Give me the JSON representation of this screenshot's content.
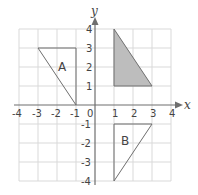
{
  "diagram": {
    "type": "coordinate-grid",
    "axes": {
      "x_label": "x",
      "y_label": "y",
      "x_range": [
        -4,
        4
      ],
      "y_range": [
        -4,
        4
      ],
      "origin_label": "0",
      "x_ticks": [
        "-4",
        "-3",
        "-2",
        "-1",
        "1",
        "2",
        "3",
        "4"
      ],
      "y_ticks": [
        "4",
        "3",
        "2",
        "1",
        "-1",
        "-2",
        "-3",
        "-4"
      ]
    },
    "shapes": [
      {
        "name": "shaded-triangle",
        "label": "",
        "vertices": [
          [
            1,
            4
          ],
          [
            1,
            1
          ],
          [
            3,
            1
          ]
        ],
        "fill": "#bdbdbd"
      },
      {
        "name": "triangle-A",
        "label": "A",
        "vertices": [
          [
            -3,
            3
          ],
          [
            -1,
            3
          ],
          [
            -1,
            0
          ]
        ],
        "fill": "none"
      },
      {
        "name": "triangle-B",
        "label": "B",
        "vertices": [
          [
            1,
            -1
          ],
          [
            3,
            -1
          ],
          [
            1,
            -4
          ]
        ],
        "fill": "none"
      }
    ],
    "colors": {
      "grid": "#d9d9d9",
      "axis": "#6e6e6e",
      "outline": "#6e6e6e",
      "shaded_fill": "#bdbdbd"
    }
  }
}
